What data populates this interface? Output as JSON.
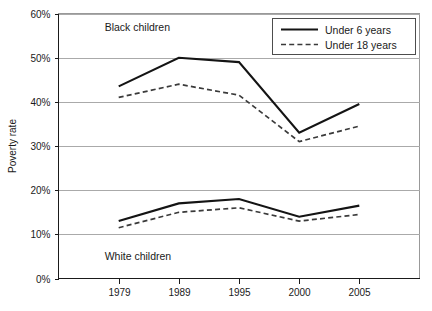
{
  "chart_data": {
    "type": "line",
    "title": "",
    "xlabel": "",
    "ylabel": "Poverty rate",
    "categories": [
      "1979",
      "1989",
      "1995",
      "2000",
      "2005"
    ],
    "ylim": [
      0,
      60
    ],
    "ytick_labels": [
      "0%",
      "10%",
      "20%",
      "30%",
      "40%",
      "50%",
      "60%"
    ],
    "ytick_values": [
      0,
      10,
      20,
      30,
      40,
      50,
      60
    ],
    "grid": true,
    "legend_position": "top-right",
    "annotations": [
      {
        "text": "Black children",
        "x": "1979",
        "y": 57
      },
      {
        "text": "White children",
        "x": "1979",
        "y": 5
      }
    ],
    "series": [
      {
        "name": "Under 6 years",
        "group": "Black children",
        "style": "solid",
        "values": [
          43.5,
          50.0,
          49.0,
          33.0,
          39.5
        ]
      },
      {
        "name": "Under 18 years",
        "group": "Black children",
        "style": "dashed",
        "values": [
          41.0,
          44.0,
          41.5,
          31.0,
          34.5
        ]
      },
      {
        "name": "Under 6 years",
        "group": "White children",
        "style": "solid",
        "values": [
          13.0,
          17.0,
          18.0,
          14.0,
          16.5
        ]
      },
      {
        "name": "Under 18 years",
        "group": "White children",
        "style": "dashed",
        "values": [
          11.5,
          15.0,
          16.0,
          13.0,
          14.5
        ]
      }
    ],
    "legend": [
      {
        "label": "Under 6 years",
        "style": "solid"
      },
      {
        "label": "Under 18 years",
        "style": "dashed"
      }
    ],
    "colors": {
      "solid_series": "#141414",
      "dashed_series": "#3a3a3a",
      "gridline": "#aaaaaa",
      "axis": "#1a1a1a",
      "background": "#ffffff"
    }
  }
}
